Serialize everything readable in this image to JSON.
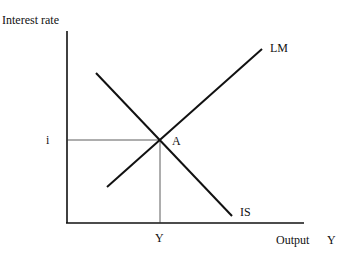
{
  "axes": {
    "y_label": "Interest rate",
    "x_label": "Output",
    "x_symbol": "Y"
  },
  "curves": {
    "lm_label": "LM",
    "is_label": "IS"
  },
  "equilibrium": {
    "point_label": "A",
    "rate_label": "i",
    "output_label": "Y"
  },
  "colors": {
    "line": "#111111",
    "guide": "#333333"
  }
}
